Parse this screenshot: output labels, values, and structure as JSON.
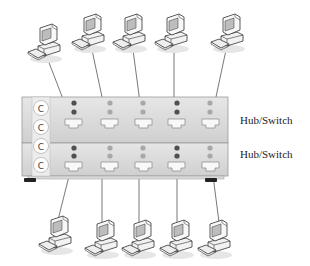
{
  "diagram": {
    "type": "network-topology",
    "switches": [
      {
        "id": "switch-top",
        "label": "Hub/Switch",
        "leds": [
          "#505050",
          "#a8a8a8",
          "#a8a8a8",
          "#505050",
          "#a8a8a8"
        ]
      },
      {
        "id": "switch-bottom",
        "label": "Hub/Switch",
        "leds": [
          "#505050",
          "#a8a8a8",
          "#a8a8a8",
          "#505050",
          "#a8a8a8"
        ]
      }
    ],
    "stack_buttons": [
      "C",
      "C",
      "C",
      "C"
    ],
    "top_computers": 5,
    "bottom_computers": 5,
    "connections": "each computer connects to one port on its nearest switch"
  },
  "colors": {
    "switch_body": "#dcdcdc",
    "switch_edge": "#9a9a9a",
    "led_active": "#505050",
    "led_idle": "#a8a8a8",
    "cable": "#555555"
  }
}
